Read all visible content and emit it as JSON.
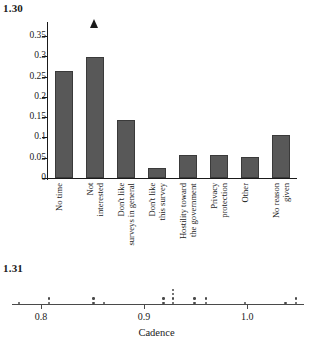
{
  "figures": {
    "bar": {
      "number": "1.30"
    },
    "dot": {
      "number": "1.31"
    }
  },
  "chart_data": [
    {
      "type": "bar",
      "title": "1.30",
      "xlabel": "",
      "ylabel": "",
      "ylim": [
        0,
        0.375
      ],
      "grid": false,
      "legend": "none",
      "yticks": [
        "0",
        "0.05",
        "0.1",
        "0.15",
        "0.2",
        "0.25",
        "0.3",
        "0.35"
      ],
      "ytick_values": [
        0,
        0.05,
        0.1,
        0.15,
        0.2,
        0.25,
        0.3,
        0.35
      ],
      "categories": [
        "No time",
        "Not interested",
        "Don't like surveys in general",
        "Don't like this survey",
        "Hostility toward the government",
        "Privacy protection",
        "Other",
        "No reason given"
      ],
      "category_lines": [
        [
          "No time"
        ],
        [
          "Not",
          "interested"
        ],
        [
          "Don't like",
          "surveys in general"
        ],
        [
          "Don't like",
          "this survey"
        ],
        [
          "Hostility toward",
          "the government"
        ],
        [
          "Privacy",
          "protection"
        ],
        [
          "Other"
        ],
        [
          "No reason",
          "given"
        ]
      ],
      "values": [
        0.265,
        0.298,
        0.143,
        0.025,
        0.058,
        0.057,
        0.052,
        0.105
      ],
      "bar_color": "#585858"
    },
    {
      "type": "dotplot",
      "title": "1.31",
      "xlabel": "Cadence",
      "ylabel": "",
      "xlim": [
        0.772,
        1.055
      ],
      "grid": false,
      "legend": "none",
      "xticks": [
        "0.8",
        "0.9",
        "1.0"
      ],
      "xtick_values": [
        0.8,
        0.9,
        1.0
      ],
      "dot_color": "#4a4a4a",
      "stacks": [
        {
          "x": 0.779,
          "count": 1
        },
        {
          "x": 0.808,
          "count": 2
        },
        {
          "x": 0.851,
          "count": 2
        },
        {
          "x": 0.861,
          "count": 1
        },
        {
          "x": 0.919,
          "count": 2
        },
        {
          "x": 0.928,
          "count": 4
        },
        {
          "x": 0.949,
          "count": 2
        },
        {
          "x": 0.96,
          "count": 2
        },
        {
          "x": 0.998,
          "count": 1
        },
        {
          "x": 1.037,
          "count": 1
        },
        {
          "x": 1.047,
          "count": 2
        }
      ]
    }
  ]
}
